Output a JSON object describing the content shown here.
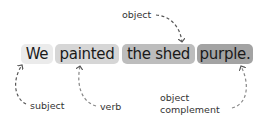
{
  "sentence": {
    "words": [
      {
        "text": "We",
        "role": "subject",
        "bg": "#ebebeb"
      },
      {
        "text": "painted",
        "role": "verb",
        "bg": "#d6d6d6"
      },
      {
        "text": "the shed",
        "role": "object",
        "bg": "#bdbdbd"
      },
      {
        "text": "purple.",
        "role": "object complement",
        "bg": "#a3a3a3"
      }
    ]
  },
  "labels": {
    "object": "object",
    "subject": "subject",
    "verb": "verb",
    "object_complement_line1": "object",
    "object_complement_line2": "complement"
  },
  "colors": {
    "arrow": "#555555",
    "text": "#1a1a1a"
  }
}
